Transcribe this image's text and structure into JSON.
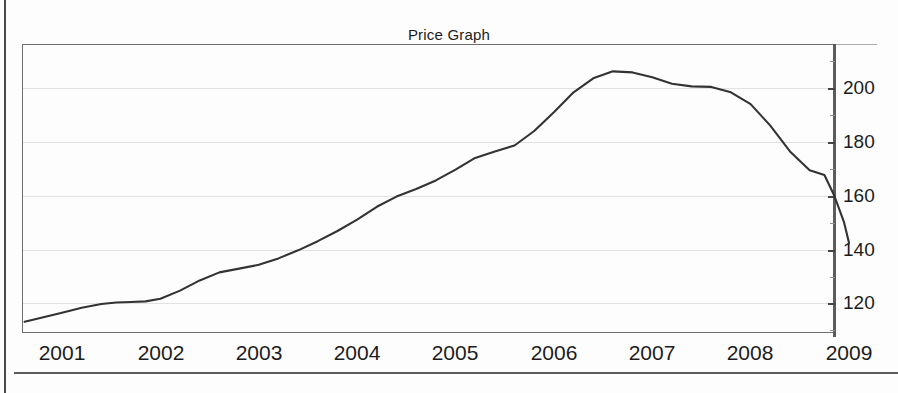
{
  "chart_data": {
    "type": "line",
    "title": "Price Graph",
    "xlabel": "",
    "ylabel": "",
    "xlim": [
      2000.6,
      2009.0
    ],
    "ylim": [
      108,
      214
    ],
    "grid": true,
    "legend": null,
    "x_tick_labels": [
      "2001",
      "2002",
      "2003",
      "2004",
      "2005",
      "2006",
      "2007",
      "2008",
      "2009"
    ],
    "x_ticks": [
      2001,
      2002,
      2003,
      2004,
      2005,
      2006,
      2007,
      2008,
      2009
    ],
    "y_tick_labels": [
      "120",
      "140",
      "160",
      "180",
      "200"
    ],
    "y_ticks": [
      120,
      140,
      160,
      180,
      200
    ],
    "y_minor_ticks": [
      110,
      130,
      150,
      170,
      190,
      210
    ],
    "series": [
      {
        "name": "Price",
        "color": "#333333",
        "x": [
          2000.62,
          2000.8,
          2001.0,
          2001.2,
          2001.4,
          2001.55,
          2001.7,
          2001.85,
          2002.0,
          2002.2,
          2002.4,
          2002.6,
          2002.8,
          2003.0,
          2003.2,
          2003.4,
          2003.6,
          2003.8,
          2004.0,
          2004.2,
          2004.4,
          2004.6,
          2004.8,
          2005.0,
          2005.2,
          2005.4,
          2005.6,
          2005.8,
          2006.0,
          2006.2,
          2006.4,
          2006.6,
          2006.8,
          2007.0,
          2007.2,
          2007.4,
          2007.6,
          2007.8,
          2008.0,
          2008.2,
          2008.4,
          2008.6,
          2008.75
        ],
        "y": [
          113.0,
          114.6,
          116.4,
          118.2,
          119.6,
          120.2,
          120.4,
          120.6,
          121.6,
          124.6,
          128.4,
          131.4,
          132.8,
          134.2,
          136.6,
          139.6,
          143.0,
          146.8,
          151.0,
          155.8,
          159.6,
          162.4,
          165.6,
          169.6,
          174.0,
          176.4,
          178.6,
          184.0,
          191.0,
          198.4,
          203.6,
          206.2,
          205.8,
          204.0,
          201.6,
          200.6,
          200.4,
          198.4,
          194.0,
          186.0,
          176.4,
          169.4,
          167.6
        ]
      }
    ]
  },
  "series_tail": {
    "x": [
      2008.75,
      2008.85,
      2008.95,
      2009.0
    ],
    "y": [
      167.6,
      160.0,
      150.0,
      142.4
    ]
  },
  "figure": {
    "background_color": "#fdfdfd",
    "line_color": "#333333",
    "grid_color": "#e2e2e2",
    "axis_color": "#5c5c5c"
  }
}
